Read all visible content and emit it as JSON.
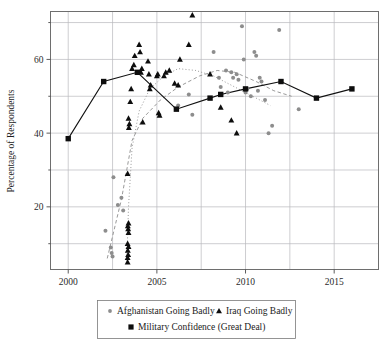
{
  "chart_data": {
    "type": "scatter",
    "title": "",
    "xlabel": "",
    "ylabel": "Percentage of Respondents",
    "xlim": [
      1999.0,
      2017.5
    ],
    "ylim": [
      3,
      73
    ],
    "xticks": [
      2000,
      2005,
      2010,
      2015
    ],
    "yticks": [
      20,
      40,
      60
    ],
    "ygrid_minor": [
      10,
      30,
      50,
      70
    ],
    "grid": true,
    "legend_position": "bottom",
    "series": [
      {
        "name": "Afghanistan Going Badly",
        "marker": "circle",
        "color": "#8d8d8d",
        "points": [
          [
            2002.1,
            13.5
          ],
          [
            2002.4,
            9.0
          ],
          [
            2002.45,
            7.5
          ],
          [
            2002.5,
            6.5
          ],
          [
            2002.55,
            28.0
          ],
          [
            2002.8,
            20.5
          ],
          [
            2003.0,
            22.5
          ],
          [
            2003.1,
            19.0
          ],
          [
            2006.2,
            47.5
          ],
          [
            2006.8,
            50.5
          ],
          [
            2007.0,
            45.0
          ],
          [
            2008.2,
            62.0
          ],
          [
            2008.5,
            55.0
          ],
          [
            2008.6,
            52.5
          ],
          [
            2008.9,
            57.0
          ],
          [
            2009.0,
            51.0
          ],
          [
            2009.2,
            56.5
          ],
          [
            2009.3,
            55.0
          ],
          [
            2009.5,
            56.0
          ],
          [
            2009.6,
            54.5
          ],
          [
            2009.8,
            69.0
          ],
          [
            2009.9,
            60.0
          ],
          [
            2010.0,
            51.0
          ],
          [
            2010.1,
            52.0
          ],
          [
            2010.3,
            50.0
          ],
          [
            2010.5,
            62.0
          ],
          [
            2010.6,
            61.0
          ],
          [
            2010.7,
            51.5
          ],
          [
            2010.8,
            55.0
          ],
          [
            2010.9,
            54.0
          ],
          [
            2011.1,
            49.0
          ],
          [
            2011.3,
            40.0
          ],
          [
            2011.5,
            42.0
          ],
          [
            2011.9,
            68.0
          ],
          [
            2013.0,
            46.5
          ]
        ]
      },
      {
        "name": "Iraq Going Badly",
        "marker": "triangle",
        "color": "#0d0d0d",
        "points": [
          [
            2003.35,
            5.0
          ],
          [
            2003.35,
            6.2
          ],
          [
            2003.38,
            7.0
          ],
          [
            2003.36,
            8.2
          ],
          [
            2003.4,
            9.2
          ],
          [
            2003.35,
            10.0
          ],
          [
            2003.4,
            13.0
          ],
          [
            2003.38,
            14.0
          ],
          [
            2003.36,
            14.8
          ],
          [
            2003.4,
            15.6
          ],
          [
            2003.35,
            29.0
          ],
          [
            2003.42,
            41.5
          ],
          [
            2003.45,
            42.5
          ],
          [
            2003.4,
            44.0
          ],
          [
            2003.5,
            48.5
          ],
          [
            2003.55,
            52.0
          ],
          [
            2003.6,
            57.5
          ],
          [
            2003.7,
            58.5
          ],
          [
            2003.75,
            61.0
          ],
          [
            2004.0,
            64.0
          ],
          [
            2004.05,
            62.0
          ],
          [
            2004.1,
            56.5
          ],
          [
            2004.15,
            57.5
          ],
          [
            2004.2,
            43.0
          ],
          [
            2004.5,
            59.5
          ],
          [
            2004.55,
            56.0
          ],
          [
            2004.6,
            52.0
          ],
          [
            2004.65,
            53.0
          ],
          [
            2005.0,
            55.5
          ],
          [
            2005.05,
            56.0
          ],
          [
            2005.1,
            45.5
          ],
          [
            2005.15,
            44.8
          ],
          [
            2005.4,
            55.5
          ],
          [
            2005.5,
            56.5
          ],
          [
            2005.7,
            57.0
          ],
          [
            2006.0,
            53.5
          ],
          [
            2006.2,
            53.0
          ],
          [
            2006.3,
            60.0
          ],
          [
            2006.8,
            64.0
          ],
          [
            2007.0,
            72.0
          ],
          [
            2008.0,
            56.0
          ],
          [
            2008.6,
            47.0
          ],
          [
            2009.2,
            43.5
          ],
          [
            2009.5,
            40.0
          ]
        ]
      },
      {
        "name": "Military Confidence (Great Deal)",
        "marker": "square",
        "color": "#0d0d0d",
        "connected": true,
        "points": [
          [
            2000.0,
            38.5
          ],
          [
            2002.0,
            54.0
          ],
          [
            2003.9,
            56.5
          ],
          [
            2006.1,
            46.5
          ],
          [
            2008.0,
            49.5
          ],
          [
            2008.6,
            50.5
          ],
          [
            2010.0,
            52.0
          ],
          [
            2012.0,
            54.0
          ],
          [
            2014.0,
            49.5
          ],
          [
            2016.0,
            52.0
          ]
        ]
      }
    ],
    "trendlines": [
      {
        "name": "afghanistan-trend",
        "style": "dashed",
        "color": "#9a9a9a",
        "points": [
          [
            2002.2,
            6.0
          ],
          [
            2003.0,
            22.0
          ],
          [
            2003.6,
            38.0
          ],
          [
            2004.2,
            44.0
          ],
          [
            2005.2,
            49.0
          ],
          [
            2006.2,
            52.5
          ],
          [
            2007.4,
            55.5
          ],
          [
            2008.4,
            57.0
          ],
          [
            2009.4,
            56.5
          ],
          [
            2010.6,
            54.0
          ],
          [
            2011.6,
            51.5
          ],
          [
            2012.6,
            50.0
          ]
        ]
      },
      {
        "name": "iraq-trend",
        "style": "dotted",
        "color": "#9a9a9a",
        "points": [
          [
            2003.3,
            4.5
          ],
          [
            2003.4,
            20.0
          ],
          [
            2003.6,
            36.0
          ],
          [
            2004.0,
            46.0
          ],
          [
            2004.6,
            52.0
          ],
          [
            2005.4,
            55.5
          ],
          [
            2006.2,
            57.5
          ],
          [
            2007.2,
            57.0
          ],
          [
            2008.2,
            55.5
          ],
          [
            2009.2,
            53.0
          ],
          [
            2010.4,
            50.0
          ],
          [
            2011.4,
            47.5
          ]
        ]
      }
    ]
  },
  "legend": {
    "items": [
      {
        "label": "Afghanistan Going Badly",
        "marker": "circle-marker"
      },
      {
        "label": "Iraq Going Badly",
        "marker": "triangle-marker"
      },
      {
        "label": "Military Confidence (Great Deal)",
        "marker": "square-marker"
      }
    ]
  },
  "axes": {
    "y_title": "Percentage of Respondents",
    "x_tick_labels": [
      "2000",
      "2005",
      "2010",
      "2015"
    ],
    "y_tick_labels": [
      "20",
      "40",
      "60"
    ]
  }
}
